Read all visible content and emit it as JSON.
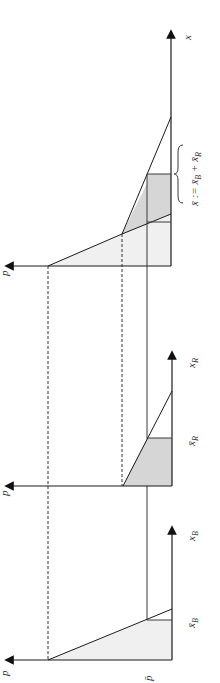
{
  "diagram": {
    "type": "economics-supply-horizontal-summation",
    "orientation": "rotated-90-ccw",
    "colors": {
      "axis": "#1a1a1a",
      "light_fill": "#f0f0f0",
      "dark_fill": "#d6d6d6",
      "dashed": "#333333"
    },
    "panels": [
      {
        "id": "aggregate",
        "quantity_axis_label": "x",
        "price_axis_label": "p",
        "brace_label": "x̄ := x̄_B + x̄_R",
        "brace_label_parts": {
          "main": "x̄ := x̄",
          "sub1": "B",
          "plus": " + x̄",
          "sub2": "R"
        }
      },
      {
        "id": "R",
        "quantity_axis_label": "x",
        "quantity_axis_sub": "R",
        "price_axis_label": "p",
        "cap_label": "x̄",
        "cap_sub": "R"
      },
      {
        "id": "B",
        "quantity_axis_label": "x",
        "quantity_axis_sub": "B",
        "price_axis_label": "p",
        "cap_label": "x̄",
        "cap_sub": "B",
        "price_level_label": "p̄"
      }
    ]
  }
}
